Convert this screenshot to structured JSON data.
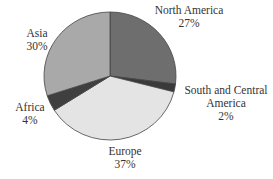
{
  "chart_data": {
    "type": "pie",
    "title": "",
    "start_angle": "12 o'clock",
    "direction": "clockwise",
    "categories": [
      "North America",
      "South and Central America",
      "Europe",
      "Africa",
      "Asia"
    ],
    "values": [
      27,
      2,
      37,
      4,
      30
    ],
    "unit": "%",
    "colors": [
      "#6e6e6e",
      "#3a3a3a",
      "#e4e4e4",
      "#3f3f3f",
      "#a9a9a9"
    ],
    "labels": [
      {
        "name": "North America",
        "value": "27%"
      },
      {
        "name_line1": "South and Central",
        "name_line2": "America",
        "value": "2%"
      },
      {
        "name": "Europe",
        "value": "37%"
      },
      {
        "name": "Africa",
        "value": "4%"
      },
      {
        "name": "Asia",
        "value": "30%"
      }
    ],
    "legend": "none (direct labels)"
  }
}
